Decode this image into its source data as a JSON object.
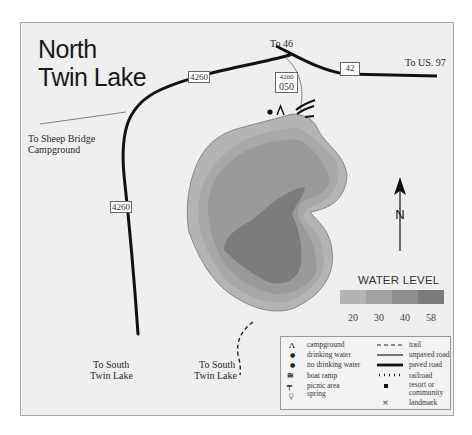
{
  "map": {
    "title_line1": "North",
    "title_line2": "Twin Lake",
    "labels": {
      "to_46": "To 46",
      "to_us97": "To US. 97",
      "to_sheep_bridge_1": "To Sheep Bridge",
      "to_sheep_bridge_2": "Campground",
      "to_south_twin_left_1": "To South",
      "to_south_twin_left_2": "Twin Lake",
      "to_south_twin_right_1": "To South",
      "to_south_twin_right_2": "Twin Lake"
    },
    "road_shields": {
      "road_4260_top": "4260",
      "road_4260_left": "4260",
      "road_4260_spur_top": "4260",
      "road_4260_spur_bottom": "050",
      "road_42": "42"
    },
    "north_arrow": {
      "label": "N"
    },
    "water_level": {
      "title": "WATER LEVEL",
      "levels": [
        "20",
        "30",
        "40",
        "58"
      ],
      "colors": [
        "#b4b4b4",
        "#a2a2a2",
        "#8f8f8f",
        "#7c7c7c"
      ]
    },
    "lake_colors": {
      "outline": "#6a6a6a",
      "level_20": "#b4b4b4",
      "level_30": "#a2a2a2",
      "level_40": "#8f8f8f",
      "level_58": "#7c7c7c"
    },
    "legend": {
      "left": [
        {
          "symbol": "Λ",
          "label": "campground"
        },
        {
          "symbol": "●",
          "label": "drinking water"
        },
        {
          "symbol": "●",
          "label": "no drinking water"
        },
        {
          "symbol": "≋",
          "label": "boat ramp"
        },
        {
          "symbol": "╤",
          "label": "picnic area"
        },
        {
          "symbol": "♀",
          "label": "spring"
        }
      ],
      "right": [
        {
          "symbol": "- - -",
          "label": "trail"
        },
        {
          "symbol": "——",
          "label": "unpaved road"
        },
        {
          "symbol": "——",
          "label": "paved road"
        },
        {
          "symbol": "╷╷╷╷╷",
          "label": "railroad"
        },
        {
          "symbol": "■",
          "label": "resort or community"
        },
        {
          "symbol": "×",
          "label": "landmark"
        }
      ]
    }
  }
}
